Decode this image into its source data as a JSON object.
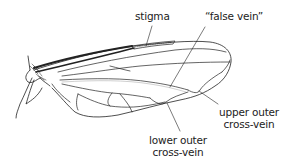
{
  "diagram": {
    "colors": {
      "background": "#ffffff",
      "line": "#222222",
      "text": "#222222"
    },
    "labels": [
      {
        "id": "stigma",
        "lines": [
          "stigma"
        ]
      },
      {
        "id": "false-vein",
        "lines": [
          "“false vein”"
        ]
      },
      {
        "id": "upper-outer-cross-vein",
        "lines": [
          "upper outer",
          "cross-vein"
        ]
      },
      {
        "id": "lower-outer-cross-vein",
        "lines": [
          "lower outer",
          "cross-vein"
        ]
      }
    ]
  }
}
